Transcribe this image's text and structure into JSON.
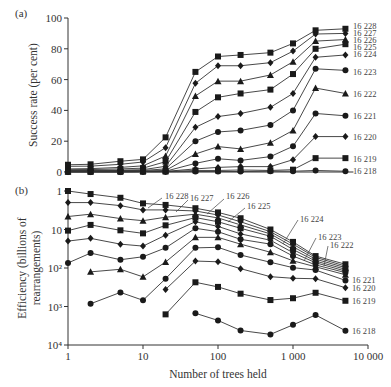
{
  "figure": {
    "panel_a_label": "(a)",
    "panel_b_label": "(b)",
    "xlabel": "Number of trees held",
    "panel_a_ylabel": "Success rate (per cent)",
    "panel_b_ylabel_line1": "Efficiency (billions of",
    "panel_b_ylabel_line2": "rearrangements)",
    "x_ticks": [
      "1",
      "10",
      "100",
      "1 000",
      "10 000"
    ],
    "a_y_ticks": [
      "0",
      "20",
      "40",
      "60",
      "80",
      "100"
    ],
    "b_y_ticks": [
      "1",
      "10",
      "10²",
      "10³",
      "10⁴"
    ]
  },
  "chart_data": [
    {
      "type": "line",
      "panel": "(a)",
      "title": "",
      "xlabel": "Number of trees held",
      "ylabel": "Success rate (per cent)",
      "xscale": "log",
      "xlim": [
        1,
        10000
      ],
      "ylim": [
        0,
        100
      ],
      "grid": false,
      "legend": "direct labels at right end of lines",
      "x": [
        1,
        2,
        5,
        10,
        20,
        50,
        100,
        200,
        500,
        1000,
        2000,
        5000
      ],
      "series": [
        {
          "name": "16 228",
          "marker": "square",
          "values": [
            4.7,
            5,
            7,
            8.2,
            22.5,
            65,
            75,
            76,
            77.5,
            83.5,
            92,
            93
          ]
        },
        {
          "name": "16 227",
          "marker": "diamond",
          "values": [
            3.7,
            3.8,
            5,
            6.5,
            15.8,
            57.6,
            69,
            69,
            71,
            78.5,
            89.6,
            90
          ]
        },
        {
          "name": "16 226",
          "marker": "triangle",
          "values": [
            2,
            2.2,
            3,
            4,
            10.4,
            49.4,
            59,
            59,
            63,
            71.6,
            85,
            86
          ]
        },
        {
          "name": "16 225",
          "marker": "square",
          "values": [
            1.5,
            1.6,
            2,
            2.5,
            6.7,
            39,
            48.5,
            51,
            53.5,
            63.6,
            80,
            83
          ]
        },
        {
          "name": "16 224",
          "marker": "diamond",
          "values": [
            1,
            1,
            1.2,
            1.5,
            3.7,
            29,
            36,
            38,
            42,
            51,
            74.5,
            76
          ]
        },
        {
          "name": "16 223",
          "marker": "circle",
          "values": [
            0.8,
            0.8,
            1,
            1,
            2,
            20,
            26,
            27,
            30.5,
            40,
            67,
            66
          ]
        },
        {
          "name": "16 222",
          "marker": "triangle",
          "values": [
            0.5,
            0.5,
            0.6,
            0.7,
            1,
            11.7,
            16.5,
            15,
            19,
            27,
            54.5,
            51
          ]
        },
        {
          "name": "16 221",
          "marker": "circle",
          "values": [
            0.3,
            0.3,
            0.4,
            0.4,
            0.5,
            5.6,
            8.6,
            7.5,
            10,
            16.7,
            38,
            36.5
          ]
        },
        {
          "name": "16 220",
          "marker": "diamond",
          "values": [
            0.2,
            0.2,
            0.2,
            0.3,
            0.4,
            2,
            3,
            3.5,
            3.5,
            8,
            23,
            23
          ]
        },
        {
          "name": "16 219",
          "marker": "square",
          "values": [
            0.1,
            0.1,
            0.1,
            0.2,
            0.3,
            1,
            1,
            1.3,
            1,
            1.5,
            9,
            9
          ]
        },
        {
          "name": "16 218",
          "marker": "circle",
          "values": [
            0,
            0,
            0,
            0.1,
            0.1,
            0.3,
            0.3,
            0.3,
            0.5,
            0.5,
            1,
            0.5
          ]
        }
      ]
    },
    {
      "type": "line",
      "panel": "(b)",
      "title": "",
      "xlabel": "Number of trees held",
      "ylabel": "Efficiency (billions of rearrangements)",
      "xscale": "log",
      "yscale": "log",
      "y_inverted": true,
      "xlim": [
        1,
        10000
      ],
      "ylim": [
        1,
        10000
      ],
      "grid": false,
      "legend": "direct labels with leader lines",
      "x": [
        1,
        2,
        5,
        10,
        20,
        50,
        100,
        200,
        500,
        1000,
        2000,
        5000
      ],
      "series": [
        {
          "name": "16 228",
          "marker": "square",
          "values": [
            1.0,
            1.2,
            1.5,
            2.1,
            2.3,
            2.8,
            3.6,
            5.1,
            10,
            21,
            49,
            80
          ]
        },
        {
          "name": "16 227",
          "marker": "diamond",
          "values": [
            2,
            2,
            2.4,
            3.1,
            3.1,
            3.3,
            4.2,
            6.3,
            11.4,
            24,
            53,
            89
          ]
        },
        {
          "name": "16 226",
          "marker": "triangle",
          "values": [
            4.6,
            4,
            5.2,
            5.9,
            4.8,
            4,
            5,
            7.6,
            13,
            28,
            59,
            98
          ]
        },
        {
          "name": "16 225",
          "marker": "square",
          "values": [
            10.7,
            7.6,
            10.5,
            12.6,
            7.8,
            4.9,
            6.3,
            9.3,
            15,
            33,
            66,
            108
          ]
        },
        {
          "name": "16 224",
          "marker": "diamond",
          "values": [
            20,
            17,
            24,
            27,
            14,
            6.3,
            8.3,
            13,
            19,
            40,
            73,
            120
          ]
        },
        {
          "name": "16 223",
          "marker": "circle",
          "values": [
            74,
            41,
            61,
            51,
            30,
            9.3,
            11.4,
            18,
            24,
            49,
            83,
            132
          ]
        },
        {
          "name": "16 222",
          "marker": "triangle",
          "values": [
            null,
            126,
            108,
            170,
            70,
            16,
            16,
            24,
            39,
            65,
            93,
            150
          ]
        },
        {
          "name": "16 221",
          "marker": "circle",
          "values": [
            null,
            850,
            430,
            690,
            190,
            30,
            29,
            46,
            71,
            98,
            113,
            210
          ]
        },
        {
          "name": "16 220",
          "marker": "diamond",
          "values": [
            null,
            null,
            null,
            null,
            360,
            66,
            69,
            104,
            168,
            185,
            190,
            325
          ]
        },
        {
          "name": "16 219",
          "marker": "square",
          "values": [
            null,
            null,
            null,
            null,
            1600,
            235,
            310,
            465,
            680,
            610,
            440,
            710
          ]
        },
        {
          "name": "16 218",
          "marker": "circle",
          "values": [
            null,
            null,
            null,
            null,
            null,
            1500,
            2300,
            4200,
            5300,
            3000,
            1660,
            4250
          ]
        }
      ]
    }
  ],
  "layout": {
    "x_px": {
      "decade_start": 68,
      "px_per_decade": 75
    },
    "a_y_px": {
      "zero": 172,
      "px_per_unit": 1.54
    },
    "b_y_px": {
      "one": 191,
      "px_per_decade": 38.5
    },
    "a_label_y": [
      26,
      33,
      40,
      47,
      54,
      72,
      94,
      116,
      137,
      159,
      171
    ],
    "b_labels": [
      {
        "text": "16 228",
        "x": 165,
        "y": 199,
        "lx1": 162,
        "ly1": 198,
        "lx2": 148,
        "ly2": 208
      },
      {
        "text": "16 227",
        "x": 190,
        "y": 201,
        "lx1": 188,
        "ly1": 200,
        "lx2": 176,
        "ly2": 212
      },
      {
        "text": "16 226",
        "x": 226,
        "y": 199,
        "lx1": 224,
        "ly1": 199,
        "lx2": 207,
        "ly2": 214
      },
      {
        "text": "16 225",
        "x": 247,
        "y": 209,
        "lx1": 245,
        "ly1": 208,
        "lx2": 228,
        "ly2": 222
      },
      {
        "text": "16 224",
        "x": 300,
        "y": 222,
        "lx1": 298,
        "ly1": 220,
        "lx2": 283,
        "ly2": 244
      },
      {
        "text": "16 223",
        "x": 318,
        "y": 240,
        "lx1": 316,
        "ly1": 238,
        "lx2": 304,
        "ly2": 261
      },
      {
        "text": "16 222",
        "x": 330,
        "y": 248,
        "lx1": 328,
        "ly1": 246,
        "lx2": 324,
        "ly2": 266
      }
    ]
  }
}
